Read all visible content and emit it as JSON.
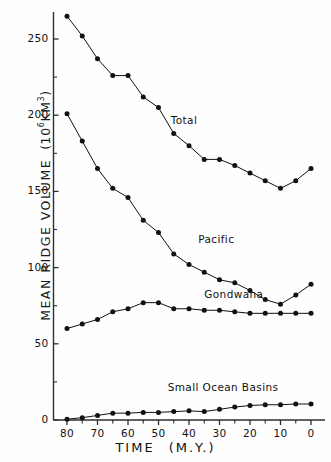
{
  "chart_data": {
    "type": "line",
    "title": "",
    "xlabel": "TIME   (M.Y.)",
    "xlabel_main": "TIME",
    "xlabel_unit": "(M.Y.)",
    "ylabel": "MEAN RIDGE VOLUME",
    "ylabel_unit": "(10⁶KM³)",
    "ylabel_unit_base": "(10",
    "ylabel_unit_exp": "6",
    "ylabel_unit_tail": "KM",
    "ylabel_unit_exp2": "3",
    "ylabel_unit_close": ")",
    "x_ticks": [
      80,
      70,
      60,
      50,
      40,
      30,
      20,
      10,
      0
    ],
    "x_minor_ticks": [
      75,
      65,
      55,
      45,
      35,
      25,
      15,
      5
    ],
    "y_ticks": [
      0,
      50,
      100,
      150,
      200,
      250
    ],
    "y_minor_ticks": [
      25,
      75,
      125,
      175,
      225
    ],
    "xlim": [
      82,
      -2
    ],
    "ylim": [
      0,
      275
    ],
    "x_reversed": true,
    "grid": false,
    "legend_position": "inline-annotations",
    "marker": "filled-circle",
    "x": [
      80,
      75,
      70,
      65,
      60,
      55,
      50,
      45,
      40,
      35,
      30,
      25,
      20,
      15,
      10,
      5,
      0
    ],
    "series": [
      {
        "name": "Total",
        "label": "Total",
        "color": "#111111",
        "values": [
          265,
          252,
          237,
          226,
          226,
          212,
          205,
          188,
          180,
          171,
          171,
          167,
          162,
          157,
          152,
          157,
          165
        ],
        "annotation_x": 46,
        "annotation_y": 196
      },
      {
        "name": "Pacific",
        "label": "Pacific",
        "color": "#111111",
        "values": [
          201,
          183,
          165,
          152,
          146,
          131,
          123,
          109,
          102,
          97,
          92,
          90,
          85,
          79,
          76,
          82,
          89
        ],
        "annotation_x": 37,
        "annotation_y": 118
      },
      {
        "name": "Gondwana",
        "label": "Gondwana",
        "color": "#111111",
        "values": [
          60,
          63,
          66,
          71,
          73,
          77,
          77,
          73,
          73,
          72,
          72,
          71,
          70,
          70,
          70,
          70,
          70
        ],
        "annotation_x": 35,
        "annotation_y": 82
      },
      {
        "name": "Small Ocean Basins",
        "label": "Small Ocean Basins",
        "color": "#111111",
        "values": [
          0.5,
          1.5,
          3,
          4.5,
          4.5,
          5,
          5,
          5.5,
          6,
          5.5,
          7,
          8.5,
          9.5,
          10,
          10,
          10.5,
          10.5
        ],
        "annotation_x": 47,
        "annotation_y": 21
      }
    ]
  }
}
